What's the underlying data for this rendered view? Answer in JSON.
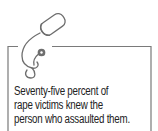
{
  "callout": {
    "icon": "stethoscope-icon",
    "lines": [
      "Seventy-five percent of",
      "rape victims knew the",
      "person who assaulted them."
    ],
    "colors": {
      "border": "#7a7a7a",
      "icon": "#6e6e6e",
      "text": "#222222",
      "background": "#ffffff"
    }
  }
}
